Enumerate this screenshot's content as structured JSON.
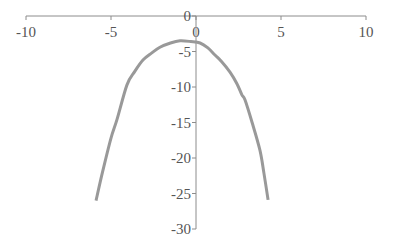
{
  "chart_data": {
    "type": "line",
    "title": "",
    "xlabel": "",
    "ylabel": "",
    "xlim": [
      -10,
      10
    ],
    "ylim": [
      -30,
      0
    ],
    "x_ticks": [
      -10,
      -5,
      0,
      5,
      10
    ],
    "y_ticks": [
      0,
      -5,
      -10,
      -15,
      -20,
      -25,
      -30
    ],
    "x_tick_labels": [
      "-10",
      "-5",
      "0",
      "5",
      "10"
    ],
    "y_tick_labels": [
      "0",
      "-5",
      "-10",
      "-15",
      "-20",
      "-25",
      "-30"
    ],
    "grid": false,
    "legend": null,
    "series": [
      {
        "name": "curve",
        "color": "#999999",
        "x": [
          -5.88,
          -5.5,
          -5.0,
          -4.65,
          -4.06,
          -3.6,
          -3.12,
          -2.6,
          -2.12,
          -1.5,
          -0.94,
          -0.3,
          0.24,
          0.7,
          1.12,
          1.5,
          2.0,
          2.4,
          2.7,
          2.88,
          3.3,
          3.76,
          4.0,
          4.24
        ],
        "y": [
          -26.0,
          -22.0,
          -17.2,
          -14.6,
          -9.7,
          -7.8,
          -6.2,
          -5.2,
          -4.4,
          -3.8,
          -3.5,
          -3.6,
          -3.8,
          -4.5,
          -5.5,
          -6.4,
          -7.9,
          -9.5,
          -11.1,
          -11.8,
          -15.0,
          -18.9,
          -22.2,
          -25.9
        ]
      }
    ]
  },
  "colors": {
    "axis": "#8c8c8c",
    "curve": "#999999",
    "label": "#555555"
  }
}
